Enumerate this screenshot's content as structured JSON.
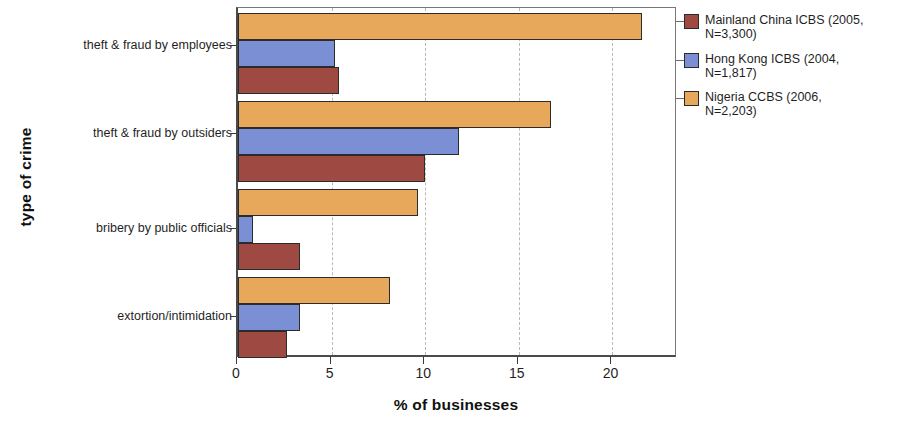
{
  "chart_data": {
    "type": "bar",
    "orientation": "horizontal",
    "title": "",
    "xlabel": "% of businesses",
    "ylabel": "type of crime",
    "categories": [
      "theft & fraud by employees",
      "theft & fraud by outsiders",
      "bribery by public officials",
      "extortion/intimidation"
    ],
    "series": [
      {
        "name": "Mainland China ICBS (2005, N=3,300)",
        "color": "#9E4A42",
        "values": [
          5.4,
          10.0,
          3.3,
          2.6
        ]
      },
      {
        "name": "Hong Kong ICBS (2004, N=1,817)",
        "color": "#7A8FD4",
        "values": [
          5.2,
          11.8,
          0.8,
          3.3
        ]
      },
      {
        "name": "Nigeria CCBS (2006, N=2,203)",
        "color": "#E8A85C",
        "values": [
          21.6,
          16.7,
          9.6,
          8.1
        ]
      }
    ],
    "xlim": [
      0,
      23.5
    ],
    "xticks": [
      0,
      5,
      10,
      15,
      20
    ],
    "xtick_labels": [
      "0",
      "5",
      "10",
      "15",
      "20"
    ],
    "grid": "vertical-dashed",
    "legend_position": "right-top"
  },
  "axes": {
    "x_title": "% of businesses",
    "y_title": "type of crime"
  },
  "legend": {
    "entries": [
      {
        "label": "Mainland China ICBS (2005,\nN=3,300)",
        "color": "#9E4A42"
      },
      {
        "label": "Hong Kong ICBS (2004,\nN=1,817)",
        "color": "#7A8FD4"
      },
      {
        "label": "Nigeria CCBS (2006,\nN=2,203)",
        "color": "#E8A85C"
      }
    ]
  },
  "categories": {
    "c0": "theft & fraud by employees",
    "c1": "theft & fraud by outsiders",
    "c2": "bribery by public officials",
    "c3": "extortion/intimidation"
  },
  "xticks": {
    "t0": "0",
    "t1": "5",
    "t2": "10",
    "t3": "15",
    "t4": "20"
  }
}
